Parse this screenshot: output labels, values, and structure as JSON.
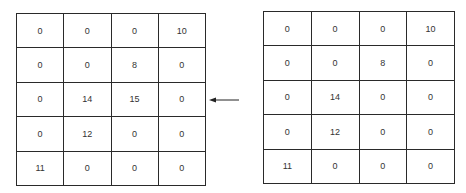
{
  "left_grid": {
    "rows": [
      [
        "0",
        "0",
        "0",
        "10"
      ],
      [
        "0",
        "0",
        "8",
        "0"
      ],
      [
        "0",
        "14",
        "15",
        "0"
      ],
      [
        "0",
        "12",
        "0",
        "0"
      ],
      [
        "11",
        "0",
        "0",
        "0"
      ]
    ]
  },
  "right_grid": {
    "rows": [
      [
        "0",
        "0",
        "0",
        "10"
      ],
      [
        "0",
        "0",
        "8",
        "0"
      ],
      [
        "0",
        "14",
        "0",
        "0"
      ],
      [
        "0",
        "12",
        "0",
        "0"
      ],
      [
        "11",
        "0",
        "0",
        "0"
      ]
    ]
  },
  "arrow": {
    "direction": "left",
    "icon": "arrow-left-icon"
  }
}
